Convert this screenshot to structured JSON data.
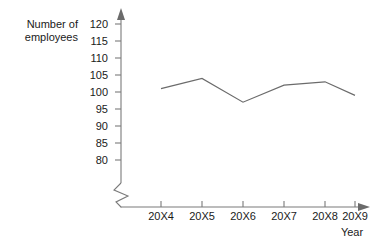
{
  "chart_data": {
    "type": "line",
    "title": "",
    "xlabel": "Year",
    "ylabel": "Number of\nemployees",
    "categories": [
      "20X4",
      "20X5",
      "20X6",
      "20X7",
      "20X8",
      "20X9"
    ],
    "values": [
      101,
      104,
      97,
      102,
      103,
      99
    ],
    "series": [
      {
        "name": "Number of employees",
        "values": [
          101,
          104,
          97,
          102,
          103,
          99
        ]
      }
    ],
    "ylim": [
      80,
      120
    ],
    "yticks": [
      80,
      85,
      90,
      95,
      100,
      105,
      110,
      115,
      120
    ],
    "ytick_labels": [
      "80",
      "85",
      "90",
      "95",
      "100",
      "105",
      "110",
      "115",
      "120"
    ],
    "xtick_labels": [
      "20X4",
      "20X5",
      "20X6",
      "20X7",
      "20X8",
      "20X9"
    ],
    "grid": false,
    "legend": false,
    "legend_position": "none",
    "axis_break": true,
    "markers": false,
    "line_color": "#6b6b6b",
    "axis_color": "#7a7a7a",
    "text_color": "#1a1a1a"
  }
}
